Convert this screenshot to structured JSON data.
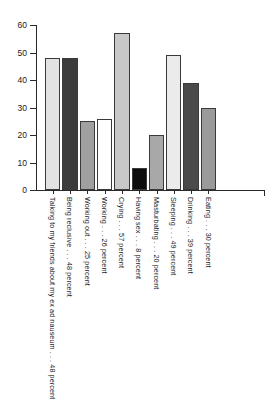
{
  "chart_data": {
    "type": "bar",
    "title": "",
    "subtitle": "",
    "xlabel": "",
    "ylabel": "",
    "ylim": [
      0,
      60
    ],
    "ytick_labels": [
      "0",
      "10",
      "20",
      "30",
      "40",
      "50",
      "60"
    ],
    "ytick_values": [
      0,
      10,
      20,
      30,
      40,
      50,
      60
    ],
    "grid": false,
    "legend": "none",
    "categories": [
      "Talking to my friends about my ex ad nauseum . . . 48 percent",
      "Being reclusive . . . 48 percent",
      "Working out . . . 25 percent",
      "Working . . . 26 percent",
      "Crying . . . 57 percent",
      "Having sex . . . 8 percent",
      "Masturbating . . . 20 percent",
      "Sleeping . . . 49 percent",
      "Drinking . . . 39 percent",
      "Eating . . . 30 percent"
    ],
    "values": [
      48,
      48,
      25,
      26,
      57,
      8,
      20,
      49,
      39,
      30
    ],
    "bar_colors": [
      "#e2e2e2",
      "#3c3c3c",
      "#a0a0a0",
      "#ffffff",
      "#c8c8c8",
      "#0d0d0d",
      "#a8a8a8",
      "#ebebeb",
      "#4a4a4a",
      "#9a9a9a"
    ]
  }
}
